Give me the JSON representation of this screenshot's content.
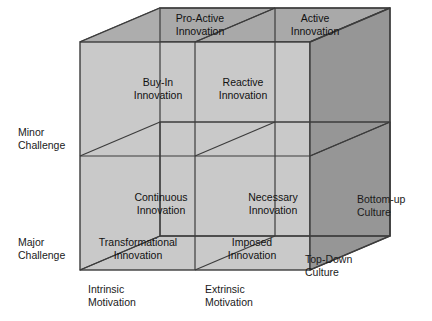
{
  "figure": {
    "type": "3d-cube-matrix",
    "colors": {
      "front_face": "#c9c9c9",
      "top_face": "#a8a8a8",
      "right_face": "#959595",
      "edge": "#3c3c3c",
      "text": "#111111",
      "background": "#ffffff"
    }
  },
  "axes": {
    "vertical": {
      "name": "Challenge",
      "labels": [
        {
          "id": "minor-challenge",
          "line1": "Minor",
          "line2": "Challenge"
        },
        {
          "id": "major-challenge",
          "line1": "Major",
          "line2": "Challenge"
        }
      ]
    },
    "horizontal": {
      "name": "Motivation",
      "labels": [
        {
          "id": "intrinsic-motivation",
          "line1": "Intrinsic",
          "line2": "Motivation"
        },
        {
          "id": "extrinsic-motivation",
          "line1": "Extrinsic",
          "line2": "Motivation"
        }
      ]
    },
    "depth": {
      "name": "Culture",
      "labels": [
        {
          "id": "bottom-up-culture",
          "line1": "Bottom-up",
          "line2": "Culture"
        },
        {
          "id": "top-down-culture",
          "line1": "Top-Down",
          "line2": "Culture"
        }
      ]
    }
  },
  "cells": {
    "top_face": [
      {
        "id": "pro-active-innovation",
        "line1": "Pro-Active",
        "line2": "Innovation"
      },
      {
        "id": "active-innovation",
        "line1": "Active",
        "line2": "Innovation"
      }
    ],
    "back_upper": [
      {
        "id": "buy-in-innovation",
        "line1": "Buy-In",
        "line2": "Innovation"
      },
      {
        "id": "reactive-innovation",
        "line1": "Reactive",
        "line2": "Innovation"
      }
    ],
    "back_lower": [
      {
        "id": "continuous-innovation",
        "line1": "Continuous",
        "line2": "Innovation"
      },
      {
        "id": "necessary-innovation",
        "line1": "Necessary",
        "line2": "Innovation"
      }
    ],
    "front_lower": [
      {
        "id": "transformational-innovation",
        "line1": "Transformational",
        "line2": "Innovation"
      },
      {
        "id": "imposed-innovation",
        "line1": "Imposed",
        "line2": "Innovation"
      }
    ]
  }
}
